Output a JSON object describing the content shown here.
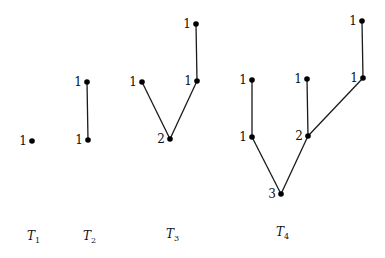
{
  "diagram": {
    "node_radius": 2.8,
    "colors": {
      "edge": "#1a1a1a",
      "node": "#000000",
      "text": "#111111",
      "background": "#ffffff"
    },
    "trees": [
      {
        "id": "T1",
        "label": {
          "main": "T",
          "sub": "1",
          "x": 27,
          "y": 240
        },
        "nodes": [
          {
            "id": "a",
            "x": 32,
            "y": 141,
            "label": "1"
          }
        ],
        "edges": []
      },
      {
        "id": "T2",
        "label": {
          "main": "T",
          "sub": "2",
          "x": 83,
          "y": 240
        },
        "nodes": [
          {
            "id": "root",
            "x": 88,
            "y": 140,
            "label": "1"
          },
          {
            "id": "top",
            "x": 87,
            "y": 82,
            "label": "1"
          }
        ],
        "edges": [
          [
            "root",
            "top"
          ]
        ]
      },
      {
        "id": "T3",
        "label": {
          "main": "T",
          "sub": "3",
          "x": 166,
          "y": 238
        },
        "nodes": [
          {
            "id": "root",
            "x": 170,
            "y": 139,
            "label": "2"
          },
          {
            "id": "left",
            "x": 142,
            "y": 82,
            "label": "1"
          },
          {
            "id": "right",
            "x": 197,
            "y": 81,
            "label": "1"
          },
          {
            "id": "top",
            "x": 196,
            "y": 24,
            "label": "1"
          }
        ],
        "edges": [
          [
            "root",
            "left"
          ],
          [
            "root",
            "right"
          ],
          [
            "right",
            "top"
          ]
        ]
      },
      {
        "id": "T4",
        "label": {
          "main": "T",
          "sub": "4",
          "x": 276,
          "y": 236
        },
        "nodes": [
          {
            "id": "root",
            "x": 281,
            "y": 194,
            "label": "3"
          },
          {
            "id": "lmid",
            "x": 252,
            "y": 137,
            "label": "1"
          },
          {
            "id": "ltop",
            "x": 252,
            "y": 80,
            "label": "1"
          },
          {
            "id": "mmid",
            "x": 308,
            "y": 136,
            "label": "2"
          },
          {
            "id": "mtop",
            "x": 307,
            "y": 79,
            "label": "1"
          },
          {
            "id": "rmid",
            "x": 363,
            "y": 78,
            "label": "1"
          },
          {
            "id": "rtop",
            "x": 362,
            "y": 21,
            "label": "1"
          }
        ],
        "edges": [
          [
            "root",
            "lmid"
          ],
          [
            "lmid",
            "ltop"
          ],
          [
            "root",
            "mmid"
          ],
          [
            "mmid",
            "mtop"
          ],
          [
            "mmid",
            "rmid"
          ],
          [
            "rmid",
            "rtop"
          ]
        ]
      }
    ]
  }
}
